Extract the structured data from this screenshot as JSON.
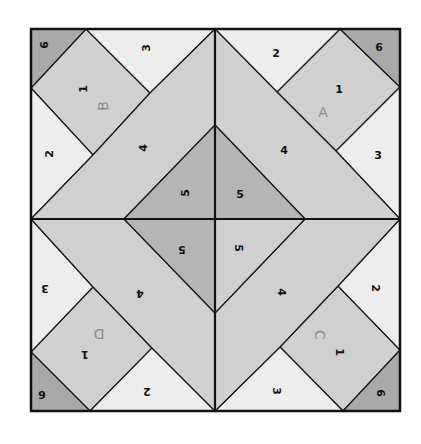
{
  "diagram": {
    "colors": {
      "light": "#ededed",
      "medium": "#d0d0d0",
      "dark": "#b5b5b5",
      "darkest": "#a9a9a9",
      "line": "#1a1a1a",
      "letter": "#8a8a8a"
    },
    "frame": {
      "x1": 31,
      "y1": 29,
      "x2": 400,
      "y2": 411,
      "cx": 215,
      "cy": 219
    },
    "quadrants": [
      {
        "id": "A",
        "position": "top-right",
        "letter": {
          "text": "A",
          "x": 323,
          "y": 112,
          "rotate": 0
        },
        "pieces": [
          {
            "num": "1",
            "tone": "medium",
            "points": "340,29 400,87 336,151 277,92",
            "label": {
              "x": 339,
              "y": 89,
              "rotate": 0
            }
          },
          {
            "num": "2",
            "tone": "light",
            "points": "215,29 340,29 277,92",
            "label": {
              "x": 276,
              "y": 53,
              "rotate": 0
            }
          },
          {
            "num": "3",
            "tone": "light",
            "points": "400,87 400,219 336,151",
            "label": {
              "x": 378,
              "y": 155,
              "rotate": 0
            }
          },
          {
            "num": "4",
            "tone": "medium",
            "points": "215,29 277,92 336,151 400,219 305,219 215,125",
            "label": {
              "x": 284,
              "y": 150,
              "rotate": 0
            }
          },
          {
            "num": "5",
            "tone": "dark",
            "points": "215,125 305,219 215,219",
            "label": {
              "x": 240,
              "y": 194,
              "rotate": 0
            }
          },
          {
            "num": "6",
            "tone": "darkest",
            "points": "340,29 400,29 400,87",
            "label": {
              "x": 379,
              "y": 47,
              "rotate": 0
            }
          }
        ]
      },
      {
        "id": "B",
        "position": "top-left",
        "letter": {
          "text": "B",
          "x": 103,
          "y": 106,
          "rotate": -90
        },
        "pieces": [
          {
            "num": "1",
            "tone": "medium",
            "points": "86,29 150,93 93,155 31,88",
            "label": {
              "x": 83,
              "y": 89,
              "rotate": -90
            }
          },
          {
            "num": "2",
            "tone": "light",
            "points": "31,88 93,155 31,219",
            "label": {
              "x": 49,
              "y": 154,
              "rotate": -90
            }
          },
          {
            "num": "3",
            "tone": "light",
            "points": "86,29 215,29 150,93",
            "label": {
              "x": 146,
              "y": 48,
              "rotate": -90
            }
          },
          {
            "num": "4",
            "tone": "medium",
            "points": "150,93 215,29 215,125 124,219 31,219 93,155",
            "label": {
              "x": 143,
              "y": 148,
              "rotate": -90
            }
          },
          {
            "num": "5",
            "tone": "dark",
            "points": "215,125 215,219 124,219",
            "label": {
              "x": 185,
              "y": 193,
              "rotate": -90
            }
          },
          {
            "num": "6",
            "tone": "darkest",
            "points": "31,29 86,29 31,88",
            "label": {
              "x": 44,
              "y": 45,
              "rotate": -90
            }
          }
        ]
      },
      {
        "id": "C",
        "position": "bottom-right",
        "letter": {
          "text": "C",
          "x": 320,
          "y": 335,
          "rotate": 90
        },
        "pieces": [
          {
            "num": "1",
            "tone": "medium",
            "points": "338,286 400,350 343,411 280,347",
            "label": {
              "x": 339,
              "y": 352,
              "rotate": 90
            }
          },
          {
            "num": "2",
            "tone": "light",
            "points": "338,286 400,219 400,350",
            "label": {
              "x": 375,
              "y": 288,
              "rotate": 90
            }
          },
          {
            "num": "3",
            "tone": "light",
            "points": "280,347 343,411 215,411",
            "label": {
              "x": 276,
              "y": 391,
              "rotate": 90
            }
          },
          {
            "num": "4",
            "tone": "medium",
            "points": "305,219 400,219 338,286 280,347 215,411 215,313",
            "label": {
              "x": 281,
              "y": 292,
              "rotate": 90
            }
          },
          {
            "num": "5",
            "tone": "medium",
            "points": "215,219 305,219 215,313",
            "label": {
              "x": 238,
              "y": 248,
              "rotate": 90
            }
          },
          {
            "num": "6",
            "tone": "darkest",
            "points": "400,350 400,411 343,411",
            "label": {
              "x": 380,
              "y": 393,
              "rotate": 90
            }
          }
        ]
      },
      {
        "id": "D",
        "position": "bottom-left",
        "letter": {
          "text": "D",
          "x": 99,
          "y": 334,
          "rotate": 180
        },
        "pieces": [
          {
            "num": "1",
            "tone": "medium",
            "points": "93,287 152,348 90,411 31,352",
            "label": {
              "x": 85,
              "y": 354,
              "rotate": 180
            }
          },
          {
            "num": "2",
            "tone": "light",
            "points": "152,348 215,411 90,411",
            "label": {
              "x": 147,
              "y": 391,
              "rotate": 180
            }
          },
          {
            "num": "3",
            "tone": "light",
            "points": "31,219 93,287 31,352",
            "label": {
              "x": 45,
              "y": 288,
              "rotate": 180
            }
          },
          {
            "num": "4",
            "tone": "medium",
            "points": "31,219 124,219 215,313 215,411 152,348 93,287",
            "label": {
              "x": 140,
              "y": 293,
              "rotate": 180
            }
          },
          {
            "num": "5",
            "tone": "dark",
            "points": "124,219 215,219 215,313",
            "label": {
              "x": 182,
              "y": 249,
              "rotate": 180
            }
          },
          {
            "num": "6",
            "tone": "darkest",
            "points": "31,352 90,411 31,411",
            "label": {
              "x": 42,
              "y": 394,
              "rotate": 180
            }
          }
        ]
      }
    ]
  }
}
